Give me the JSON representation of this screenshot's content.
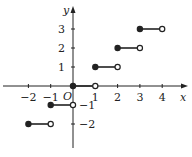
{
  "chart_data": {
    "type": "line",
    "title": "",
    "function": "y = floor(x) (greatest integer function)",
    "xlabel": "x",
    "ylabel": "y",
    "origin_label": "O",
    "xlim": [
      -2.5,
      4.8
    ],
    "ylim": [
      -3.3,
      4
    ],
    "grid": false,
    "x_ticks": [
      -2,
      -1,
      1,
      2,
      3,
      4
    ],
    "x_tick_labels": [
      "−2",
      "−1",
      "1",
      "2",
      "3",
      "4"
    ],
    "y_ticks": [
      -2,
      -1,
      1,
      2,
      3
    ],
    "y_tick_labels": [
      "−2",
      "−1",
      "1",
      "2",
      "3"
    ],
    "segments": [
      {
        "x_start": -2,
        "x_end": -1,
        "y": -2,
        "start": "closed",
        "end": "open"
      },
      {
        "x_start": -1,
        "x_end": 0,
        "y": -1,
        "start": "closed",
        "end": "open"
      },
      {
        "x_start": 0,
        "x_end": 1,
        "y": 0,
        "start": "closed",
        "end": "open"
      },
      {
        "x_start": 1,
        "x_end": 2,
        "y": 1,
        "start": "closed",
        "end": "open"
      },
      {
        "x_start": 2,
        "x_end": 3,
        "y": 2,
        "start": "closed",
        "end": "open"
      },
      {
        "x_start": 3,
        "x_end": 4,
        "y": 3,
        "start": "closed",
        "end": "open"
      }
    ],
    "colors": {
      "ink": "#222222",
      "background": "#ffffff"
    }
  }
}
